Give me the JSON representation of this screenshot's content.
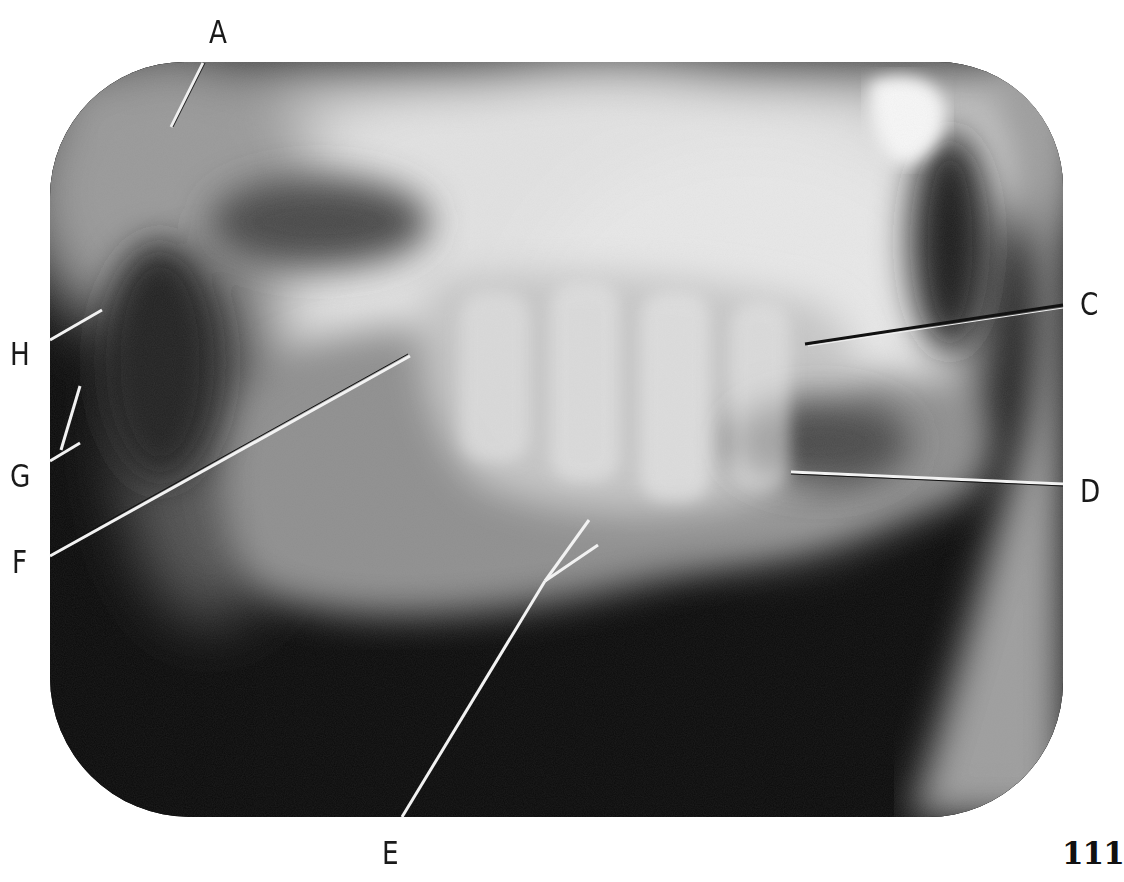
{
  "figure": {
    "type": "dental radiograph",
    "view": "lateral jaw (posterior teeth, upper and lower)",
    "labels": [
      {
        "id": "A",
        "text": "A"
      },
      {
        "id": "B_absent",
        "text": ""
      },
      {
        "id": "C",
        "text": "C"
      },
      {
        "id": "D",
        "text": "D"
      },
      {
        "id": "E",
        "text": "E"
      },
      {
        "id": "F",
        "text": "F"
      },
      {
        "id": "G",
        "text": "G"
      },
      {
        "id": "H",
        "text": "H"
      }
    ]
  },
  "labels": {
    "a": "A",
    "c": "C",
    "d": "D",
    "e": "E",
    "f": "F",
    "g": "G",
    "h": "H"
  },
  "page": {
    "number": "111"
  },
  "colors": {
    "paper": "#ffffff",
    "film_dark": "#0b0b0b",
    "bone_light": "#e6e6e6",
    "leader_light": "#f2f2f2",
    "leader_dark": "#111111",
    "text": "#1a1a1a"
  }
}
